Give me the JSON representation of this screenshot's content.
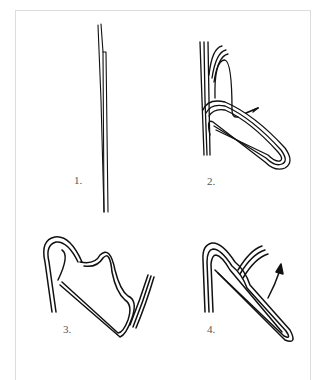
{
  "figure": {
    "panels": [
      {
        "id": 1,
        "label": "1.",
        "depicts": "straight doubled cord hanging vertically"
      },
      {
        "id": 2,
        "label": "2.",
        "depicts": "cord folded into a long loop, working end wrapped around with direction arrow"
      },
      {
        "id": 3,
        "label": "3.",
        "depicts": "working end twisted around loop in a spiral wrap"
      },
      {
        "id": 4,
        "label": "4.",
        "depicts": "wraps tightened near the top, end pulled with arrow"
      }
    ]
  },
  "colors": {
    "ink": "#111111",
    "frame": "#dcdcdc",
    "label": "#555555"
  }
}
